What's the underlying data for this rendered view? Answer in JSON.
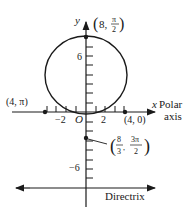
{
  "diagram": {
    "colors": {
      "ink": "#1a1a1a",
      "background": "#ffffff"
    },
    "axes": {
      "y_label": "y",
      "x_label": "x",
      "polar_axis_label_line1": "Polar",
      "polar_axis_label_line2": "axis",
      "origin_label": "O",
      "x_ticks": {
        "neg2": "−2",
        "pos2": "2"
      },
      "y_ticks": {
        "pos6": "6",
        "neg6": "−6"
      }
    },
    "points": {
      "top": {
        "label_prefix": "(8, ",
        "num": "π",
        "den": "2",
        "suffix": ")"
      },
      "right": {
        "label": "(4, 0)"
      },
      "left": {
        "label": "(4, π)"
      },
      "bottom": {
        "label_prefix": "(",
        "num1": "8",
        "den1": "3",
        "num2": "3π",
        "den2": "2",
        "suffix": ")"
      }
    },
    "directrix_label": "Directrix"
  }
}
